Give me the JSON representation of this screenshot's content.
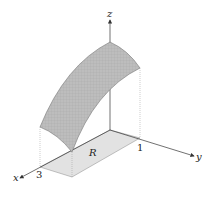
{
  "figure": {
    "type": "3d-surface-over-region",
    "axes": {
      "x": {
        "label": "x",
        "tick": "3"
      },
      "y": {
        "label": "y",
        "tick": "1"
      },
      "z": {
        "label": "z"
      }
    },
    "region_label": "R",
    "colors": {
      "surface": "#b8b8b8",
      "surface_edge": "#777777",
      "region": "#e2e2e2",
      "axis": "#333333",
      "dotted": "#999999"
    }
  }
}
